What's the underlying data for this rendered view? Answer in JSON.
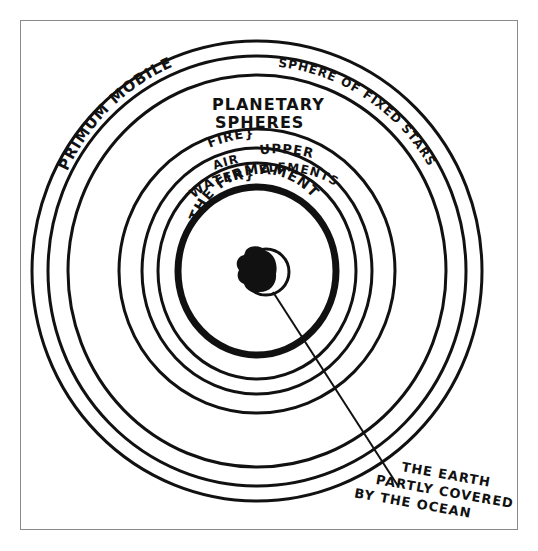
{
  "diagram": {
    "colors": {
      "ink": "#111111",
      "frame": "#8a8a8a",
      "background": "#ffffff"
    },
    "center": {
      "x": 257,
      "y": 271
    },
    "spheres": [
      {
        "id": "primum-mobile-outer",
        "rx": 225,
        "ry": 230,
        "stroke": 3
      },
      {
        "id": "fixed-stars-outer",
        "rx": 209,
        "ry": 215,
        "stroke": 3
      },
      {
        "id": "planetary-outer",
        "rx": 189,
        "ry": 196,
        "stroke": 3
      },
      {
        "id": "fire",
        "rx": 138,
        "ry": 142,
        "stroke": 3
      },
      {
        "id": "air",
        "rx": 115,
        "ry": 123,
        "stroke": 3
      },
      {
        "id": "water",
        "rx": 99,
        "ry": 108,
        "stroke": 3
      },
      {
        "id": "firmament",
        "rx": 79,
        "ry": 84,
        "stroke": 7
      }
    ],
    "labels": {
      "primum_mobile": "PRIMUM MOBILE",
      "fixed_stars": "SPHERE OF FIXED STARS",
      "planetary_line1": "PLANETARY",
      "planetary_line2": "SPHERES",
      "fire": "FIRE}",
      "air": "AIR",
      "water": "WATER}",
      "upper": "UPPER",
      "elements": "ELEMENTS",
      "firmament": "THE FIRMAMENT",
      "earth_line1": "THE EARTH",
      "earth_line2": "PARTLY COVERED",
      "earth_line3": "BY THE OCEAN"
    }
  }
}
